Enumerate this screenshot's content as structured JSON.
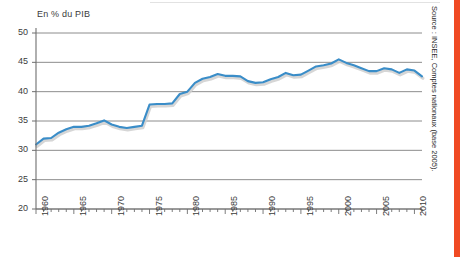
{
  "figure": {
    "axis_title": "En % du PIB",
    "source_note": "Source : INSEE, Comptes nationaux (base 2005).",
    "accent_color": "#f04a23",
    "line_color": "#3a8dc8",
    "grid_color": "#808080",
    "text_color": "#3b3b3b"
  },
  "chart_data": {
    "type": "line",
    "title": "",
    "subtitle": "",
    "xlabel": "",
    "ylabel": "En % du PIB",
    "ylim": [
      20,
      50
    ],
    "xlim": [
      1960,
      2011
    ],
    "yticks": [
      50,
      45,
      40,
      35,
      30,
      25,
      20
    ],
    "xticks": [
      1960,
      1965,
      1970,
      1975,
      1980,
      1985,
      1990,
      1995,
      2000,
      2005,
      2010
    ],
    "grid": "horizontal",
    "legend": "none",
    "minor_xticks_every": 1,
    "series": [
      {
        "name": "Dépenses publiques en % du PIB",
        "color": "#3a8dc8",
        "x": [
          1960,
          1961,
          1962,
          1963,
          1964,
          1965,
          1966,
          1967,
          1968,
          1969,
          1970,
          1971,
          1972,
          1973,
          1974,
          1975,
          1976,
          1977,
          1978,
          1979,
          1980,
          1981,
          1982,
          1983,
          1984,
          1985,
          1986,
          1987,
          1988,
          1989,
          1990,
          1991,
          1992,
          1993,
          1994,
          1995,
          1996,
          1997,
          1998,
          1999,
          2000,
          2001,
          2002,
          2003,
          2004,
          2005,
          2006,
          2007,
          2008,
          2009,
          2010,
          2011
        ],
        "values": [
          31.0,
          32.0,
          32.1,
          33.0,
          33.6,
          34.0,
          34.0,
          34.2,
          34.6,
          35.1,
          34.4,
          34.0,
          33.8,
          34.0,
          34.2,
          37.8,
          37.9,
          37.9,
          38.0,
          39.6,
          40.0,
          41.5,
          42.2,
          42.5,
          43.0,
          42.7,
          42.7,
          42.6,
          41.8,
          41.5,
          41.6,
          42.1,
          42.5,
          43.2,
          42.8,
          42.9,
          43.6,
          44.3,
          44.5,
          44.8,
          45.5,
          44.9,
          44.5,
          44.0,
          43.5,
          43.5,
          44.0,
          43.8,
          43.2,
          43.8,
          43.6,
          42.6
        ]
      }
    ]
  }
}
